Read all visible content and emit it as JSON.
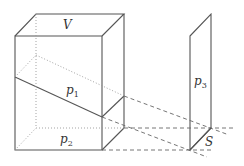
{
  "labels": {
    "volume": "V",
    "plane1": {
      "base": "p",
      "sub": "1"
    },
    "plane2": {
      "base": "p",
      "sub": "2"
    },
    "plane3": {
      "base": "p",
      "sub": "3"
    },
    "surface": "S"
  },
  "colors": {
    "stroke": "#555555",
    "hidden": "#888888",
    "background": "#ffffff"
  }
}
